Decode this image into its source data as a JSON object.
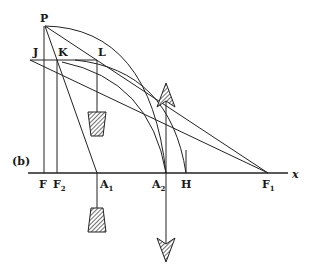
{
  "figure": {
    "panel_label": "(b)",
    "points": {
      "P": {
        "label": "P",
        "x": 45,
        "y": 26
      },
      "J": {
        "label": "J",
        "x": 36,
        "y": 60
      },
      "K": {
        "label": "K",
        "x": 58,
        "y": 60
      },
      "L": {
        "label": "L",
        "x": 97,
        "y": 60
      },
      "F": {
        "label": "F",
        "x": 44,
        "y": 173
      },
      "F2": {
        "label": "F",
        "sub": "2",
        "x": 57,
        "y": 173
      },
      "A1": {
        "label": "A",
        "sub": "1",
        "x": 97,
        "y": 173
      },
      "A2": {
        "label": "A",
        "sub": "2",
        "x": 166,
        "y": 173
      },
      "H": {
        "label": "H",
        "x": 186,
        "y": 173
      },
      "F1": {
        "label": "F",
        "sub": "1",
        "x": 268,
        "y": 173
      }
    },
    "axis": {
      "label": "x",
      "y": 173,
      "x_start": 28,
      "x_end": 288
    },
    "colors": {
      "ink": "#222222",
      "background": "#ffffff"
    }
  }
}
